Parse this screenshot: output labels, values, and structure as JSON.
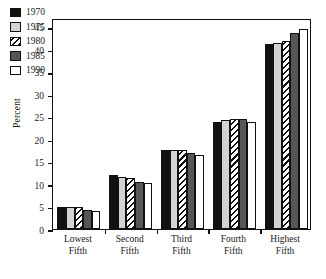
{
  "chart_data": {
    "type": "bar",
    "title": "",
    "subtitle": "",
    "xlabel": "",
    "ylabel": "Percent",
    "ylim": [
      0,
      47
    ],
    "yticks": [
      0,
      5,
      10,
      15,
      20,
      25,
      30,
      35,
      40,
      45
    ],
    "ytick_labels": [
      "0",
      "5",
      "10",
      "15",
      "20",
      "25",
      "30",
      "35",
      "40",
      "45"
    ],
    "grid": false,
    "legend_position": "upper-left-inside",
    "categories": [
      "Lowest Fifth",
      "Second Fifth",
      "Third Fifth",
      "Fourth Fifth",
      "Highest Fifth"
    ],
    "category_lines": [
      [
        "Lowest",
        "Fifth"
      ],
      [
        "Second",
        "Fifth"
      ],
      [
        "Third",
        "Fifth"
      ],
      [
        "Fourth",
        "Fifth"
      ],
      [
        "Highest",
        "Fifth"
      ]
    ],
    "series": [
      {
        "name": "1970",
        "fill": "solid-black",
        "color": "#111111",
        "values": [
          5.0,
          12.0,
          17.6,
          23.9,
          41.2
        ]
      },
      {
        "name": "1975",
        "fill": "light-gray",
        "color": "#d3d3d3",
        "values": [
          4.9,
          11.6,
          17.6,
          24.2,
          41.4
        ]
      },
      {
        "name": "1980",
        "fill": "diagonal-hatch",
        "color": "#ffffff",
        "values": [
          4.8,
          11.3,
          17.5,
          24.4,
          41.9
        ]
      },
      {
        "name": "1985",
        "fill": "dark-gray",
        "color": "#565656",
        "values": [
          4.2,
          10.5,
          16.9,
          24.4,
          43.6
        ]
      },
      {
        "name": "1990",
        "fill": "white",
        "color": "#ffffff",
        "values": [
          4.1,
          10.3,
          16.4,
          23.8,
          44.6
        ]
      }
    ]
  },
  "legend": {
    "items": [
      {
        "label": "1970",
        "swatch": "solid-black-swatch"
      },
      {
        "label": "1975",
        "swatch": "light-gray-swatch"
      },
      {
        "label": "1980",
        "swatch": "diagonal-hatch-swatch"
      },
      {
        "label": "1985",
        "swatch": "dark-gray-swatch"
      },
      {
        "label": "1990",
        "swatch": "white-swatch"
      }
    ]
  },
  "axes": {
    "y_title": "Percent"
  }
}
